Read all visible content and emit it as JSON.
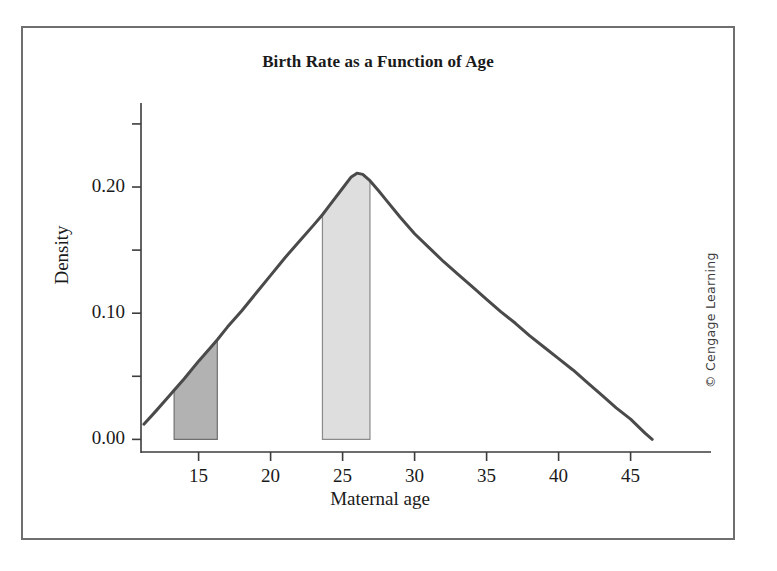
{
  "figure": {
    "title": "Birth Rate as a Function of Age",
    "copyright": "© Cengage Learning"
  },
  "chart_data": {
    "type": "area",
    "title": "Birth Rate as a Function of Age",
    "xlabel": "Maternal age",
    "ylabel": "Density",
    "xlim": [
      11.0,
      48.5
    ],
    "ylim": [
      -0.01,
      0.265
    ],
    "grid": false,
    "legend": null,
    "x_ticks": [
      15,
      20,
      25,
      30,
      35,
      40,
      45
    ],
    "x_tick_labels": [
      "15",
      "20",
      "25",
      "30",
      "35",
      "40",
      "45"
    ],
    "y_ticks": [
      0.0,
      0.05,
      0.1,
      0.15,
      0.2,
      0.25
    ],
    "y_tick_labels": [
      "0.00",
      "",
      "0.10",
      "",
      "0.20",
      ""
    ],
    "y_major_ticks": [
      0.0,
      0.1,
      0.2
    ],
    "series": [
      {
        "name": "Birth rate density",
        "color": "#4a4a4a",
        "line_width": 3,
        "x": [
          11.2,
          12.0,
          13.0,
          13.3,
          14.0,
          15.0,
          16.0,
          16.3,
          17.0,
          18.0,
          19.0,
          20.0,
          21.0,
          22.0,
          23.0,
          23.6,
          24.0,
          25.0,
          25.6,
          26.0,
          26.4,
          26.9,
          27.5,
          28.0,
          29.0,
          30.0,
          31.0,
          32.0,
          33.0,
          34.0,
          35.0,
          36.0,
          37.0,
          38.0,
          39.0,
          40.0,
          41.0,
          42.0,
          43.0,
          44.0,
          45.0,
          46.0,
          46.5
        ],
        "y": [
          0.012,
          0.022,
          0.035,
          0.039,
          0.048,
          0.062,
          0.075,
          0.079,
          0.089,
          0.102,
          0.116,
          0.13,
          0.144,
          0.157,
          0.17,
          0.178,
          0.184,
          0.199,
          0.208,
          0.211,
          0.21,
          0.205,
          0.197,
          0.19,
          0.176,
          0.163,
          0.152,
          0.141,
          0.131,
          0.121,
          0.111,
          0.101,
          0.092,
          0.082,
          0.073,
          0.064,
          0.055,
          0.045,
          0.035,
          0.025,
          0.016,
          0.005,
          0.0
        ]
      }
    ],
    "shaded_regions": [
      {
        "name": "teen-age-region",
        "x_start": 13.3,
        "x_end": 16.3,
        "fill": "#b2b2b2",
        "edge": "#6f6f6f"
      },
      {
        "name": "peak-age-region",
        "x_start": 23.6,
        "x_end": 26.9,
        "fill": "#dedede",
        "edge": "#8a8a8a"
      }
    ]
  }
}
